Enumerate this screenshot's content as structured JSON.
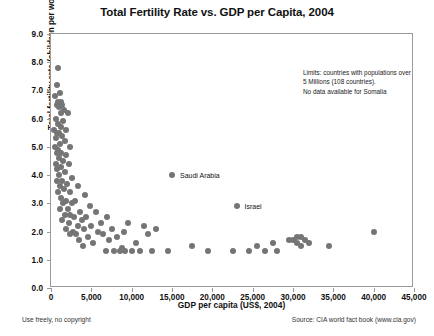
{
  "chart_data": {
    "type": "scatter",
    "title": "Total Fertility Rate vs. GDP per Capita, 2004",
    "xlabel": "GDP per capita (US$, 2004)",
    "ylabel": "Total fertility rate (children per woman)",
    "xlim": [
      0,
      45000
    ],
    "ylim": [
      0.0,
      9.0
    ],
    "xticks": [
      0,
      5000,
      10000,
      15000,
      20000,
      25000,
      30000,
      35000,
      40000,
      45000
    ],
    "xtick_labels": [
      "0",
      "5,000",
      "10,000",
      "15,000",
      "20,000",
      "25,000",
      "30,000",
      "35,000",
      "40,000",
      "45,000"
    ],
    "yticks": [
      0.0,
      1.0,
      2.0,
      3.0,
      4.0,
      5.0,
      6.0,
      7.0,
      8.0,
      9.0
    ],
    "ytick_labels": [
      "0.0",
      "1.0",
      "2.0",
      "3.0",
      "4.0",
      "5.0",
      "6.0",
      "7.0",
      "8.0",
      "9.0"
    ],
    "grid": false,
    "legend": "none",
    "marker_color": "#757575",
    "marker_size": 6,
    "annotation": "Limits: countries with populations over 5 Millions (108 countries). No data available for Somalia",
    "annotation_lines": [
      "Limits: countries with populations over",
      "5 Millions (108 countries).",
      "No data available for Somalia"
    ],
    "point_labels": [
      {
        "text": "Saudi Arabia",
        "x": 15000,
        "y": 4.0
      },
      {
        "text": "Israel",
        "x": 23000,
        "y": 2.9
      }
    ],
    "points": [
      [
        900,
        7.8
      ],
      [
        700,
        7.2
      ],
      [
        1100,
        6.9
      ],
      [
        500,
        6.8
      ],
      [
        900,
        6.6
      ],
      [
        1200,
        6.6
      ],
      [
        1400,
        6.5
      ],
      [
        800,
        6.5
      ],
      [
        1000,
        6.4
      ],
      [
        1600,
        6.3
      ],
      [
        1300,
        6.2
      ],
      [
        2100,
        6.2
      ],
      [
        600,
        6.0
      ],
      [
        1500,
        5.9
      ],
      [
        900,
        5.8
      ],
      [
        1200,
        5.7
      ],
      [
        400,
        5.6
      ],
      [
        1800,
        5.6
      ],
      [
        1000,
        5.5
      ],
      [
        800,
        5.5
      ],
      [
        1400,
        5.4
      ],
      [
        600,
        5.3
      ],
      [
        1700,
        5.2
      ],
      [
        1100,
        5.1
      ],
      [
        500,
        5.0
      ],
      [
        2400,
        5.0
      ],
      [
        900,
        4.9
      ],
      [
        1300,
        4.8
      ],
      [
        700,
        4.8
      ],
      [
        1900,
        4.7
      ],
      [
        1000,
        4.6
      ],
      [
        1500,
        4.5
      ],
      [
        600,
        4.4
      ],
      [
        2200,
        4.4
      ],
      [
        1200,
        4.3
      ],
      [
        800,
        4.2
      ],
      [
        1700,
        4.1
      ],
      [
        15000,
        4.0
      ],
      [
        1000,
        4.0
      ],
      [
        2600,
        3.9
      ],
      [
        1400,
        3.8
      ],
      [
        700,
        3.8
      ],
      [
        2000,
        3.7
      ],
      [
        1100,
        3.6
      ],
      [
        3400,
        3.6
      ],
      [
        1600,
        3.5
      ],
      [
        900,
        3.4
      ],
      [
        2300,
        3.4
      ],
      [
        4200,
        3.3
      ],
      [
        1300,
        3.2
      ],
      [
        1900,
        3.1
      ],
      [
        3000,
        3.1
      ],
      [
        2600,
        3.0
      ],
      [
        1500,
        3.0
      ],
      [
        23000,
        2.9
      ],
      [
        4800,
        2.9
      ],
      [
        2100,
        2.8
      ],
      [
        1100,
        2.8
      ],
      [
        3600,
        2.7
      ],
      [
        5600,
        2.7
      ],
      [
        2400,
        2.6
      ],
      [
        1700,
        2.6
      ],
      [
        4400,
        2.5
      ],
      [
        7000,
        2.5
      ],
      [
        2900,
        2.5
      ],
      [
        1400,
        2.4
      ],
      [
        3800,
        2.4
      ],
      [
        6200,
        2.3
      ],
      [
        9500,
        2.3
      ],
      [
        2200,
        2.3
      ],
      [
        5000,
        2.2
      ],
      [
        3300,
        2.2
      ],
      [
        11500,
        2.2
      ],
      [
        1800,
        2.1
      ],
      [
        7500,
        2.1
      ],
      [
        4100,
        2.1
      ],
      [
        13000,
        2.1
      ],
      [
        2700,
        2.0
      ],
      [
        5800,
        2.0
      ],
      [
        9000,
        2.0
      ],
      [
        40000,
        2.0
      ],
      [
        3100,
        1.9
      ],
      [
        6500,
        1.9
      ],
      [
        12000,
        1.9
      ],
      [
        2400,
        1.9
      ],
      [
        4600,
        1.8
      ],
      [
        8200,
        1.8
      ],
      [
        30500,
        1.8
      ],
      [
        31000,
        1.8
      ],
      [
        29500,
        1.7
      ],
      [
        31500,
        1.7
      ],
      [
        30000,
        1.7
      ],
      [
        3500,
        1.7
      ],
      [
        7200,
        1.7
      ],
      [
        27500,
        1.6
      ],
      [
        32000,
        1.6
      ],
      [
        30500,
        1.6
      ],
      [
        5200,
        1.6
      ],
      [
        10500,
        1.6
      ],
      [
        25500,
        1.5
      ],
      [
        31000,
        1.5
      ],
      [
        34500,
        1.5
      ],
      [
        17500,
        1.5
      ],
      [
        4000,
        1.5
      ],
      [
        8800,
        1.4
      ],
      [
        14500,
        1.3
      ],
      [
        19500,
        1.3
      ],
      [
        22500,
        1.3
      ],
      [
        24500,
        1.3
      ],
      [
        26500,
        1.3
      ],
      [
        28000,
        1.3
      ],
      [
        6800,
        1.3
      ],
      [
        9200,
        1.3
      ],
      [
        10000,
        1.3
      ],
      [
        11000,
        1.3
      ],
      [
        12500,
        1.3
      ],
      [
        7800,
        1.3
      ],
      [
        8500,
        1.3
      ]
    ]
  },
  "footer": {
    "left": "Use freely, no copyright",
    "right": "Source: CIA world fact book (www.cia.gov)"
  }
}
